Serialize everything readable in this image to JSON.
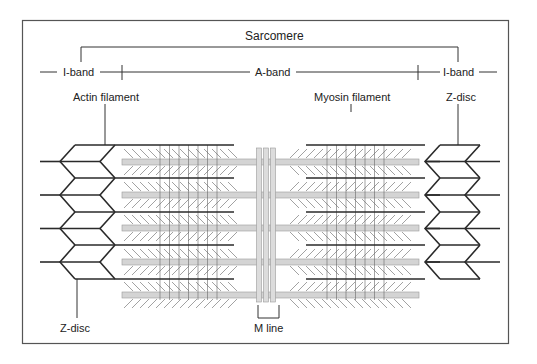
{
  "title": "Sarcomere",
  "bands": {
    "left_i_band": "I-band",
    "a_band": "A-band",
    "right_i_band": "I-band"
  },
  "labels": {
    "actin_filament": "Actin filament",
    "myosin_filament": "Myosin filament",
    "z_disc_top": "Z-disc",
    "z_disc_bottom": "Z-disc",
    "m_line": "M line"
  },
  "colors": {
    "line": "#2a2a2a",
    "myosin": "#d4d4d4",
    "myosin_edge": "#9a9a9a",
    "heads": "#8a8a8a",
    "frame": "#555555"
  },
  "structure": {
    "z_disc_rows": 4,
    "actin_filaments_per_side": 5,
    "myosin_filaments": 5
  }
}
